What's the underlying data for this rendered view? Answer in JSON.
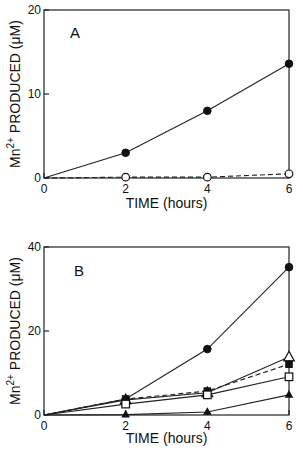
{
  "chart_data": [
    {
      "type": "line",
      "panel_label": "A",
      "title": "",
      "xlabel": "TIME (hours)",
      "ylabel": "Mn2+ PRODUCED (μM)",
      "xlim": [
        0,
        6
      ],
      "ylim": [
        0,
        20
      ],
      "x_ticks": [
        "0",
        "2",
        "4",
        "6"
      ],
      "y_ticks": [
        "0",
        "10",
        "20"
      ],
      "grid": false,
      "legend": "none",
      "x": [
        0,
        2,
        4,
        6
      ],
      "series": [
        {
          "name": "filled circles (solid line)",
          "marker": "filled-circle",
          "line": "solid",
          "values": [
            0,
            3.0,
            8.0,
            13.6
          ]
        },
        {
          "name": "open circles (dashed line)",
          "marker": "open-circle",
          "line": "dashed",
          "values": [
            0,
            0.1,
            0.1,
            0.5
          ]
        }
      ]
    },
    {
      "type": "line",
      "panel_label": "B",
      "title": "",
      "xlabel": "TIME (hours)",
      "ylabel": "Mn2+ PRODUCED (μM)",
      "xlim": [
        0,
        6
      ],
      "ylim": [
        0,
        40
      ],
      "x_ticks": [
        "0",
        "2",
        "4",
        "6"
      ],
      "y_ticks": [
        "0",
        "20",
        "40"
      ],
      "grid": false,
      "legend": "none",
      "x": [
        0,
        2,
        4,
        6
      ],
      "series": [
        {
          "name": "filled circles",
          "marker": "filled-circle",
          "line": "solid",
          "values": [
            0,
            3.8,
            15.7,
            35.2
          ]
        },
        {
          "name": "open triangles",
          "marker": "open-triangle",
          "line": "solid",
          "values": [
            0,
            3.6,
            5.3,
            13.8
          ]
        },
        {
          "name": "filled squares",
          "marker": "filled-square",
          "line": "dashed",
          "values": [
            0,
            3.8,
            5.7,
            12.1
          ]
        },
        {
          "name": "open squares",
          "marker": "open-square",
          "line": "solid",
          "values": [
            0,
            2.6,
            4.8,
            9.1
          ]
        },
        {
          "name": "filled triangles",
          "marker": "filled-triangle",
          "line": "solid",
          "values": [
            0,
            0.1,
            0.7,
            4.8
          ]
        }
      ]
    }
  ],
  "labels": {
    "panelA": "A",
    "panelB": "B",
    "xlabel": "TIME (hours)",
    "ylabel_main": "PRODUCED (μM)",
    "ylabel_mn": "Mn",
    "ylabel_sup": "2+"
  }
}
